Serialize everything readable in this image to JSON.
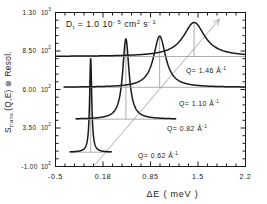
{
  "chart_data": {
    "type": "line",
    "title": "",
    "annotation_title": "D_t = 1.0   10^-5 cm^2 s^-1",
    "annotation_parts": {
      "symbol": "D",
      "subscript": "t",
      "equals": "=",
      "value": "1.0",
      "mantissa": "10",
      "exponent": "- 5",
      "unit1": "cm",
      "unit1_exp": "2",
      "unit2": "s",
      "unit2_exp": "- 1"
    },
    "xlabel": "ΔE ( meV )",
    "ylabel": "S         (Q,E)  ⊗  Resol.",
    "ylabel_parts": {
      "main": "S",
      "subscript": "trans.",
      "rest": "(Q,E)  ⊗  Resol."
    },
    "xlim": [
      -0.5,
      2.2
    ],
    "ylim": [
      -100,
      1300
    ],
    "xticks": [
      -0.5,
      0.175,
      0.85,
      1.525,
      2.2
    ],
    "xticklabels": [
      "-0.5",
      "0.18",
      "0.85",
      "1.5",
      "2.2"
    ],
    "yticks": [
      -100,
      250,
      600,
      950,
      1300
    ],
    "yticklabels": [
      {
        "mantissa": "-1.00",
        "base": "10",
        "exp": "2"
      },
      {
        "mantissa": "3.50",
        "base": "10",
        "exp": "2"
      },
      {
        "mantissa": "6.00",
        "base": "10",
        "exp": "2"
      },
      {
        "mantissa": "8.50",
        "base": "10",
        "exp": "2"
      },
      {
        "mantissa": "1.30",
        "base": "10",
        "exp": "3"
      }
    ],
    "minor_ticks_per_interval": 4,
    "grid": false,
    "legend": "inline-annotations",
    "diagonal_arrow": {
      "label": "increasing Q",
      "visible": true
    },
    "series": [
      {
        "name": "Q= 0.62 Å⁻¹",
        "q_value": 0.62,
        "label": {
          "prefix": "Q=",
          "value": "0.62",
          "unit": "Å",
          "unit_exp": "-1"
        },
        "center": 0.0,
        "hwhm": 0.018,
        "baseline": 30,
        "peak": 880,
        "color": "#1a1a1a"
      },
      {
        "name": "Q= 0.82 Å⁻¹",
        "q_value": 0.82,
        "label": {
          "prefix": "Q=",
          "value": "0.82",
          "unit": "Å",
          "unit_exp": "-1"
        },
        "center": 0.5,
        "hwhm": 0.055,
        "baseline": 330,
        "peak": 1060,
        "color": "#1a1a1a"
      },
      {
        "name": "Q= 1.10 Å⁻¹",
        "q_value": 1.1,
        "label": {
          "prefix": "Q=",
          "value": "1.10",
          "unit": "Å",
          "unit_exp": "-1"
        },
        "center": 0.98,
        "hwhm": 0.105,
        "baseline": 620,
        "peak": 1085,
        "color": "#1a1a1a"
      },
      {
        "name": "Q= 1.46 Å⁻¹",
        "q_value": 1.46,
        "label": {
          "prefix": "Q=",
          "value": "1.46",
          "unit": "Å",
          "unit_exp": "-1"
        },
        "center": 1.47,
        "hwhm": 0.185,
        "baseline": 900,
        "peak": 1210,
        "color": "#1a1a1a"
      }
    ],
    "colors": {
      "curve": "#1a1a1a",
      "axis": "#1a1a1a",
      "guide": "#999999",
      "background": "#ffffff"
    }
  }
}
